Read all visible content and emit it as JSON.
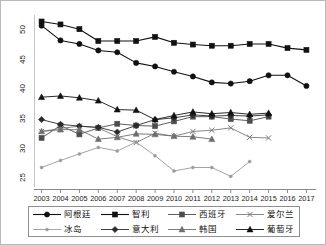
{
  "chart_data": {
    "type": "line",
    "title": "",
    "xlabel": "",
    "ylabel": "",
    "x": [
      2003,
      2004,
      2005,
      2006,
      2007,
      2008,
      2009,
      2010,
      2011,
      2012,
      2013,
      2014,
      2015,
      2016,
      2017
    ],
    "xtick_labels": [
      "2003",
      "2004",
      "2005",
      "2006",
      "2007",
      "2008",
      "2009",
      "2010",
      "2011",
      "2012",
      "2013",
      "2014",
      "2015",
      "2016",
      "2017"
    ],
    "ytick_labels": [
      "25",
      "30",
      "35",
      "40",
      "45",
      "50"
    ],
    "yticks": [
      25,
      30,
      35,
      40,
      45,
      50
    ],
    "ylim": [
      23.5,
      52.6
    ],
    "xlim": [
      2002.6,
      2017.4
    ],
    "grid": false,
    "legend_position": "bottom",
    "legend_columns": 4,
    "series": [
      {
        "name": "阿根廷",
        "marker": "circle",
        "color": "#111111",
        "values": [
          50.8,
          48.3,
          47.7,
          46.6,
          46.3,
          44.5,
          43.9,
          43.0,
          42.2,
          41.2,
          41.0,
          41.4,
          42.4,
          42.4,
          40.6
        ]
      },
      {
        "name": "智利",
        "marker": "square",
        "color": "#111111",
        "values": [
          51.5,
          51.0,
          50.2,
          48.2,
          48.2,
          48.2,
          48.9,
          47.9,
          47.6,
          47.4,
          47.4,
          47.7,
          47.7,
          47.0,
          46.7
        ]
      },
      {
        "name": "西班牙",
        "marker": "square",
        "color": "#4d4d4d",
        "values": [
          31.8,
          33.9,
          32.4,
          33.5,
          34.2,
          33.9,
          33.8,
          34.6,
          35.4,
          35.4,
          35.0,
          34.7,
          35.4,
          null,
          null
        ]
      },
      {
        "name": "爱尔兰",
        "marker": "cross",
        "color": "#7a7a7a",
        "values": [
          32.9,
          33.4,
          33.8,
          33.5,
          32.0,
          31.0,
          32.6,
          32.1,
          32.9,
          33.1,
          33.5,
          31.9,
          31.8,
          null,
          null
        ]
      },
      {
        "name": "冰岛",
        "marker": "dot",
        "color": "#9a9a9a",
        "values": [
          26.8,
          28.0,
          29.1,
          30.2,
          29.6,
          31.1,
          28.8,
          26.2,
          26.8,
          26.8,
          25.3,
          27.8,
          null,
          null,
          null
        ]
      },
      {
        "name": "意大利",
        "marker": "diamond",
        "color": "#2b2b2b",
        "values": [
          34.9,
          34.1,
          33.8,
          33.6,
          32.8,
          33.9,
          34.9,
          35.2,
          35.7,
          35.5,
          35.6,
          35.5,
          35.7,
          null,
          null
        ]
      },
      {
        "name": "韩国",
        "marker": "triangle",
        "color": "#6e6e6e",
        "values": [
          32.9,
          33.2,
          33.2,
          31.6,
          31.9,
          32.5,
          32.4,
          32.1,
          32.0,
          31.6,
          null,
          null,
          null,
          null,
          null
        ]
      },
      {
        "name": "葡萄牙",
        "marker": "triangle",
        "color": "#111111",
        "values": [
          38.7,
          38.9,
          38.6,
          38.1,
          36.6,
          36.5,
          34.9,
          35.6,
          36.2,
          35.9,
          36.1,
          35.8,
          36.0,
          null,
          null
        ]
      }
    ]
  },
  "legend": {
    "rows": [
      [
        {
          "label": "阿根廷",
          "series": 0
        },
        {
          "label": "智利",
          "series": 1
        },
        {
          "label": "西班牙",
          "series": 2
        },
        {
          "label": "爱尔兰",
          "series": 3
        }
      ],
      [
        {
          "label": "冰岛",
          "series": 4
        },
        {
          "label": "意大利",
          "series": 5
        },
        {
          "label": "韩国",
          "series": 6
        },
        {
          "label": "葡萄牙",
          "series": 7
        }
      ]
    ]
  }
}
